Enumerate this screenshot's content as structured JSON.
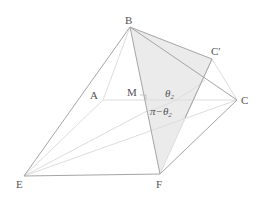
{
  "diagram": {
    "labels": {
      "B": "B",
      "A": "A",
      "M": "M",
      "C": "C",
      "C_prime": "C′",
      "E": "E",
      "F": "F",
      "theta": "θ",
      "theta_sub": "2",
      "pi_minus": "π−θ",
      "pi_sub": "2"
    },
    "colors": {
      "edge": "#9a9a9a",
      "faint": "#dcdcdc",
      "shade": "#ececec",
      "text": "#555555"
    }
  }
}
